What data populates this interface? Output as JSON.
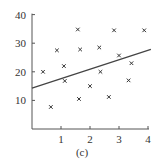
{
  "chart_data": {
    "type": "scatter",
    "title": "",
    "caption": "(c)",
    "xlabel": "",
    "ylabel": "",
    "xlim": [
      0,
      4
    ],
    "ylim": [
      0,
      40
    ],
    "xticks": [
      "1",
      "2",
      "3",
      "4"
    ],
    "yticks": [
      "10",
      "20",
      "30",
      "40"
    ],
    "grid": false,
    "marker": "x",
    "points": [
      [
        0.38,
        20
      ],
      [
        0.65,
        7.7
      ],
      [
        0.86,
        27.5
      ],
      [
        1.1,
        22
      ],
      [
        1.13,
        16.8
      ],
      [
        1.58,
        34.8
      ],
      [
        1.66,
        27.8
      ],
      [
        1.62,
        10.5
      ],
      [
        2.0,
        15
      ],
      [
        2.32,
        28.5
      ],
      [
        2.36,
        20
      ],
      [
        2.65,
        11.2
      ],
      [
        2.83,
        34.5
      ],
      [
        3.0,
        25.7
      ],
      [
        3.33,
        17
      ],
      [
        3.43,
        23
      ],
      [
        3.87,
        34.5
      ]
    ],
    "fit_line": {
      "x": [
        0,
        4.1
      ],
      "y": [
        14.3,
        27.8
      ]
    }
  }
}
